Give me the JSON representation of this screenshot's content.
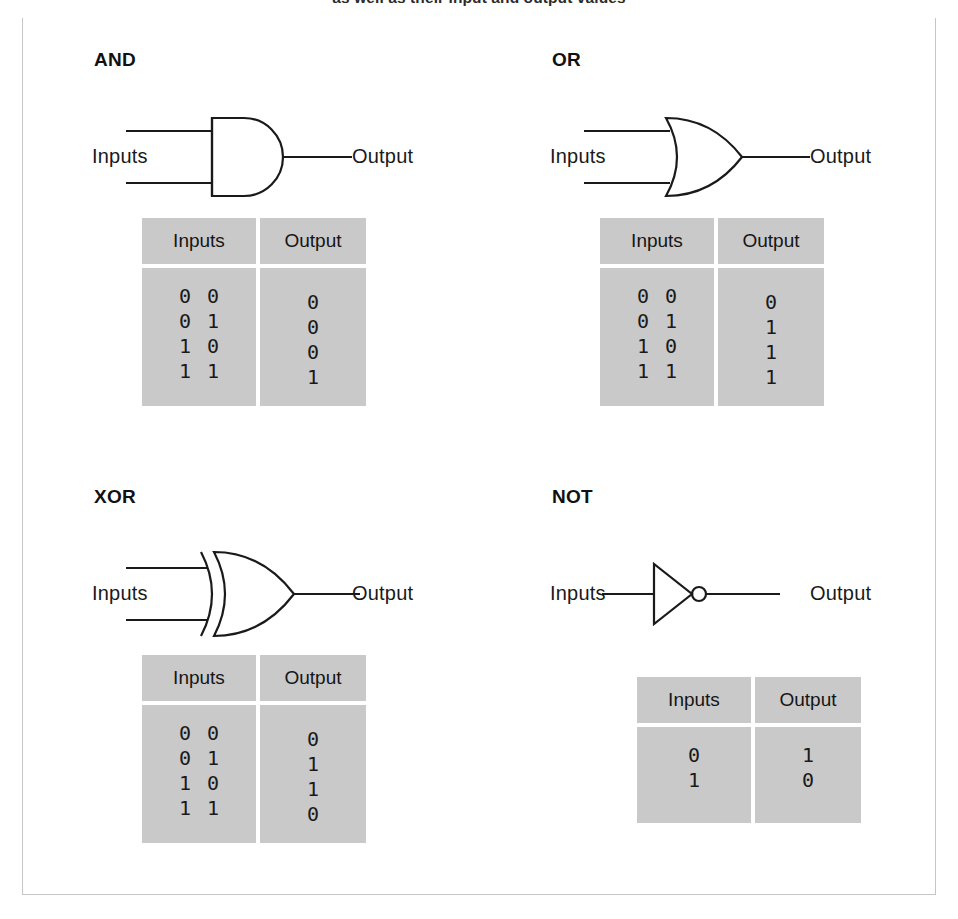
{
  "caption": {
    "text": "as well as their input and output values"
  },
  "figure": {
    "background": "#ffffff",
    "frame_border_color": "#c6c6c6",
    "frame_top_rule_color": "#333333",
    "table_fill_color": "#c9c9c9",
    "table_divider_color": "#ffffff",
    "line_color": "#1a1a1a"
  },
  "labels": {
    "inputs": "Inputs",
    "output": "Output"
  },
  "gates": [
    {
      "id": "and",
      "title": "AND",
      "symbol": "and-gate-symbol",
      "input_count": 2,
      "table": {
        "headers": [
          "Inputs",
          "Output"
        ],
        "rows": [
          {
            "inputs": [
              "0",
              "0"
            ],
            "output": "0"
          },
          {
            "inputs": [
              "0",
              "1"
            ],
            "output": "0"
          },
          {
            "inputs": [
              "1",
              "0"
            ],
            "output": "0"
          },
          {
            "inputs": [
              "1",
              "1"
            ],
            "output": "1"
          }
        ]
      }
    },
    {
      "id": "or",
      "title": "OR",
      "symbol": "or-gate-symbol",
      "input_count": 2,
      "table": {
        "headers": [
          "Inputs",
          "Output"
        ],
        "rows": [
          {
            "inputs": [
              "0",
              "0"
            ],
            "output": "0"
          },
          {
            "inputs": [
              "0",
              "1"
            ],
            "output": "1"
          },
          {
            "inputs": [
              "1",
              "0"
            ],
            "output": "1"
          },
          {
            "inputs": [
              "1",
              "1"
            ],
            "output": "1"
          }
        ]
      }
    },
    {
      "id": "xor",
      "title": "XOR",
      "symbol": "xor-gate-symbol",
      "input_count": 2,
      "table": {
        "headers": [
          "Inputs",
          "Output"
        ],
        "rows": [
          {
            "inputs": [
              "0",
              "0"
            ],
            "output": "0"
          },
          {
            "inputs": [
              "0",
              "1"
            ],
            "output": "1"
          },
          {
            "inputs": [
              "1",
              "0"
            ],
            "output": "1"
          },
          {
            "inputs": [
              "1",
              "1"
            ],
            "output": "0"
          }
        ]
      }
    },
    {
      "id": "not",
      "title": "NOT",
      "symbol": "not-gate-symbol",
      "input_count": 1,
      "table": {
        "headers": [
          "Inputs",
          "Output"
        ],
        "rows": [
          {
            "inputs": [
              "0"
            ],
            "output": "1"
          },
          {
            "inputs": [
              "1"
            ],
            "output": "0"
          }
        ]
      }
    }
  ]
}
